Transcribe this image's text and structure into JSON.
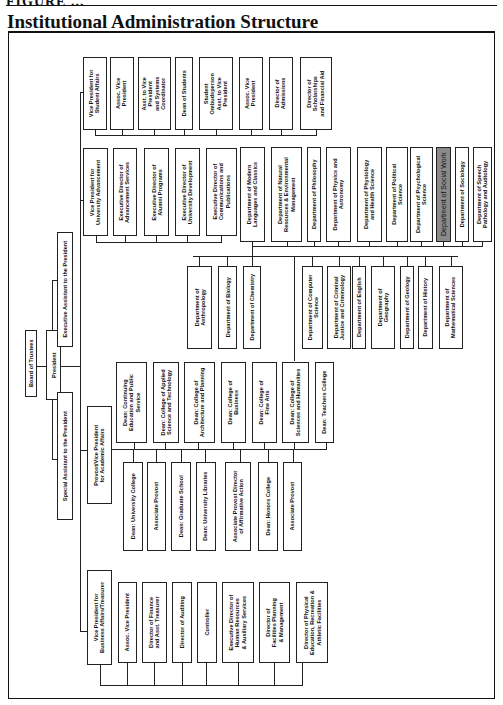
{
  "page": {
    "header_fragment": "FIGURE ...",
    "title": "Institutional Administration Structure"
  },
  "chart": {
    "orientation": "rotated 90 degrees; text reads bottom-to-top",
    "root": {
      "board": "Board of Trustees",
      "president": "President",
      "executive_assistant": "Executive Assistant to the President",
      "special_assistant": "Special Assistant to the President"
    },
    "student_affairs": {
      "head": "Vice President for\nStudent Affairs",
      "units": [
        "Assoc. Vice\nPresident",
        "Asst. to Vice\nPresident\nand Systems\nCoordinator",
        "Dean of Students",
        "Student\nOmbudsperson\nAsst. to Vice\nPresident",
        "Assoc. Vice\nPresident",
        "Director of\nAdmissions",
        "Director of\nScholarships\nand Financial Aid"
      ]
    },
    "advancement": {
      "head": "Vice President for\nUniversity Advancement",
      "units": [
        "Executive Director of\nAdvancement Services",
        "Executive Director of\nAlumni Programs",
        "Executive Director of\nUniversity Development",
        "Executive Director of\nCommunications and\nPublications"
      ]
    },
    "departments_upper": [
      "Department of Modern\nLanguages and Classics",
      "Department of Natural\nResources & Environmental\nManagement",
      "Department of Philosophy",
      "Department of Physics and\nAstronomy",
      "Department of Physiology\nand Health Science",
      "Department of Political\nScience",
      "Department of Psychological\nScience",
      "Department of Social Work",
      "Department of Sociology",
      "Department of Speech\nPathology and Audiology"
    ],
    "highlighted_department": "Department of Social Work",
    "departments_lower": [
      "Department of\nAnthropology",
      "Department of Biology",
      "Department of Chemistry",
      "Department of Computer\nScience",
      "Department of Criminal\nJustice and Criminology",
      "Department of English",
      "Department of\nGeography",
      "Department of Geology",
      "Department of History",
      "Department of\nMathematical Sciences"
    ],
    "academic_affairs": {
      "head": "Provost/Vice President\nfor Academic Affairs",
      "deans": [
        "Dean: Continuing\nEducation and Public\nService",
        "Dean: College of Applied\nScience and Technology",
        "Dean: College of\nArchitecture and Planning",
        "Dean: College of\nBusiness",
        "Dean: College of\nFine Arts",
        "Dean: College of\nSciences and Humanities",
        "Dean: Teachers College"
      ],
      "units": [
        "Dean: University College",
        "Associate Provost",
        "Dean: Graduate School",
        "Dean: University Libraries",
        "Associate Provost Director\nof Affirmative Action",
        "Dean: Honors College",
        "Associate Provost"
      ]
    },
    "business_affairs": {
      "head": "Vice President for\nBusiness Affairs/Treasurer",
      "units": [
        "Assoc. Vice President",
        "Director of Finance\nand Asst. Treasurer",
        "Director of Auditing",
        "Controller",
        "Executive Director of\nHuman Resources\n& Auxiliary Services",
        "Director of\nFacilities Planning\n& Management",
        "Director of Physical\nEducation, Recreation &\nAthletic Facilities"
      ]
    }
  },
  "colors": {
    "line": "#222222",
    "highlight_fill": "#8a8a8a",
    "background": "#ffffff"
  }
}
